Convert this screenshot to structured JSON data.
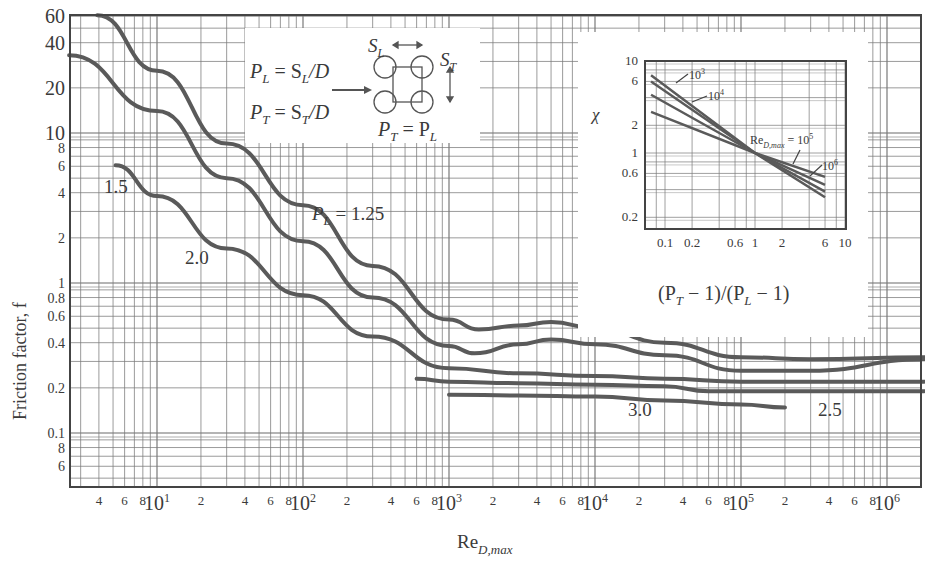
{
  "chart_data": {
    "type": "line",
    "title": "",
    "xlabel": "Re_D,max",
    "ylabel": "Friction factor, f",
    "xscale": "log",
    "yscale": "log",
    "xlim": [
      2.7,
      1800000
    ],
    "ylim": [
      0.044,
      60
    ],
    "grid": true,
    "x_tick_labels": [
      "4",
      "6",
      "8",
      "10^1",
      "2",
      "4",
      "6",
      "8",
      "10^2",
      "2",
      "4",
      "6",
      "8",
      "10^3",
      "2",
      "4",
      "6",
      "8",
      "10^4",
      "2",
      "4",
      "6",
      "8",
      "10^5",
      "2",
      "4",
      "6",
      "8",
      "10^6"
    ],
    "y_tick_labels": [
      "60",
      "40",
      "20",
      "10",
      "8",
      "6",
      "4",
      "2",
      "1",
      "0.8",
      "0.6",
      "0.4",
      "0.2",
      "0.1",
      "8",
      "6"
    ],
    "series": [
      {
        "name": "P_L = 1.25",
        "label": "P_L = 1.25",
        "x": [
          3.9,
          10,
          30,
          100,
          300,
          1000,
          1600,
          3000,
          5000,
          10000,
          30000,
          100000,
          300000,
          1800000
        ],
        "y": [
          61,
          26,
          8.5,
          3.3,
          1.3,
          0.57,
          0.49,
          0.52,
          0.55,
          0.5,
          0.4,
          0.32,
          0.31,
          0.32
        ]
      },
      {
        "name": "P_L = 1.5",
        "label": "1.5",
        "x": [
          2.5,
          10,
          30,
          100,
          300,
          1000,
          1500,
          3000,
          5000,
          10000,
          30000,
          100000,
          300000,
          1800000
        ],
        "y": [
          33,
          14,
          5.0,
          1.9,
          0.8,
          0.38,
          0.34,
          0.39,
          0.42,
          0.39,
          0.33,
          0.26,
          0.26,
          0.31
        ]
      },
      {
        "name": "P_L = 2.0",
        "label": "2.0",
        "x": [
          5.2,
          10,
          30,
          100,
          300,
          1000,
          3000,
          10000,
          30000,
          100000,
          1800000
        ],
        "y": [
          6.1,
          3.8,
          1.7,
          0.83,
          0.44,
          0.27,
          0.25,
          0.24,
          0.23,
          0.22,
          0.22
        ]
      },
      {
        "name": "P_L = 2.5",
        "label": "2.5",
        "x": [
          600,
          1000,
          3000,
          10000,
          30000,
          60000,
          100000,
          1800000
        ],
        "y": [
          0.23,
          0.22,
          0.215,
          0.21,
          0.205,
          0.19,
          0.19,
          0.19
        ]
      },
      {
        "name": "P_L = 3.0",
        "label": "3.0",
        "x": [
          1000,
          3000,
          10000,
          30000,
          100000,
          200000
        ],
        "y": [
          0.18,
          0.178,
          0.175,
          0.165,
          0.155,
          0.148
        ]
      }
    ],
    "annotations": [
      {
        "text": "P_L = S_L/D"
      },
      {
        "text": "P_T = S_T/D"
      },
      {
        "text": "P_T = P_L"
      },
      {
        "text": "S_L"
      },
      {
        "text": "S_T"
      }
    ],
    "inset": {
      "type": "line",
      "xlabel": "(P_T − 1)/(P_L − 1)",
      "ylabel": "χ",
      "xscale": "log",
      "yscale": "log",
      "x_tick_labels": [
        "0.1",
        "0.2",
        "0.6",
        "1",
        "2",
        "6",
        "10"
      ],
      "y_tick_labels": [
        "10",
        "6",
        "2",
        "1",
        "0.6",
        "0.2"
      ],
      "xlim": [
        0.06,
        10
      ],
      "ylim": [
        0.15,
        10
      ],
      "series": [
        {
          "name": "Re_D,max = 10^3",
          "x": [
            0.07,
            1,
            6
          ],
          "y": [
            7.0,
            1.0,
            0.33
          ]
        },
        {
          "name": "Re_D,max = 10^4",
          "x": [
            0.07,
            1,
            6
          ],
          "y": [
            6.0,
            1.0,
            0.38
          ]
        },
        {
          "name": "Re_D,max = 10^5",
          "x": [
            0.07,
            1,
            6
          ],
          "y": [
            4.3,
            1.0,
            0.45
          ]
        },
        {
          "name": "Re_D,max = 10^6",
          "x": [
            0.07,
            1,
            6
          ],
          "y": [
            2.8,
            1.0,
            0.55
          ]
        }
      ],
      "labels": [
        "10^3",
        "10^4",
        "Re_D,max = 10^5",
        "10^6"
      ]
    }
  },
  "labels": {
    "ylabel": "Friction factor, f",
    "xlabel_main": "Re",
    "xlabel_sub": "D,max",
    "curve_125": "P",
    "curve_125_sub": "L",
    "curve_125_val": " = 1.25",
    "curve_15": "1.5",
    "curve_20": "2.0",
    "curve_25": "2.5",
    "curve_30": "3.0",
    "eq1_lhs": "P",
    "eq1_lhs_sub": "L",
    "eq1_rhs": " = S",
    "eq1_rhs_sub": "L",
    "eq1_tail": "/D",
    "eq2_lhs": "P",
    "eq2_lhs_sub": "T",
    "eq2_rhs": " = S",
    "eq2_rhs_sub": "T",
    "eq2_tail": "/D",
    "eq3_a": "P",
    "eq3_a_sub": "T",
    "eq3_mid": " = P",
    "eq3_b_sub": "L",
    "sl": "S",
    "sl_sub": "L",
    "st": "S",
    "st_sub": "T",
    "inset_ylabel": "χ",
    "inset_xlabel": "(P",
    "inset_xlabel_sub1": "T",
    "inset_xlabel_mid": " − 1)/(P",
    "inset_xlabel_sub2": "L",
    "inset_xlabel_tail": " − 1)",
    "inset_103": "10",
    "inset_103_sup": "3",
    "inset_104": "10",
    "inset_104_sup": "4",
    "inset_105_pre": "Re",
    "inset_105_sub": "D,max",
    "inset_105": " = 10",
    "inset_105_sup": "5",
    "inset_106": "10",
    "inset_106_sup": "6"
  },
  "colors": {
    "curve": "#5a5a5a",
    "grid": "#7a7a7a",
    "frame": "#444444",
    "text": "#3a3a3a"
  }
}
